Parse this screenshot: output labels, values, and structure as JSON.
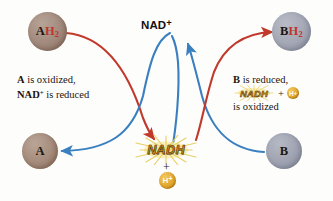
{
  "diagram": {
    "colors": {
      "oxidation_arrow": "#c0392b",
      "reduction_arrow": "#3a7fbf",
      "nadh_text": "#d98f14",
      "nadh_glow": "#f7e07a",
      "hplus_circle": "#e1a62c",
      "circle_a_fill": "#a1897c",
      "circle_b_fill": "#a3a7b4",
      "label_dark": "#1a1510",
      "label_red": "#c0352a",
      "background": "#fdfdfc"
    },
    "molecules": {
      "ah2": {
        "base": "A",
        "hydrogen": "H",
        "hydrogen_count": "2"
      },
      "bh2": {
        "base": "B",
        "hydrogen": "H",
        "hydrogen_count": "2"
      },
      "a": {
        "label": "A"
      },
      "b": {
        "label": "B"
      }
    },
    "center": {
      "top_label": "NAD",
      "top_charge": "+",
      "bottom_label": "NADH",
      "plus": "+",
      "proton": "H",
      "proton_charge": "+"
    },
    "captions": {
      "left": {
        "line1_bold": "A",
        "line1_rest": " is oxidized,",
        "line2_bold": "NAD",
        "line2_charge": "+",
        "line2_rest": " is reduced"
      },
      "right": {
        "line1_bold": "B",
        "line1_rest": " is reduced,",
        "line2_nadh": "NADH",
        "line2_plus": "+",
        "line2_proton": "H",
        "line2_proton_charge": "+",
        "line3": "is oxidized"
      }
    }
  }
}
